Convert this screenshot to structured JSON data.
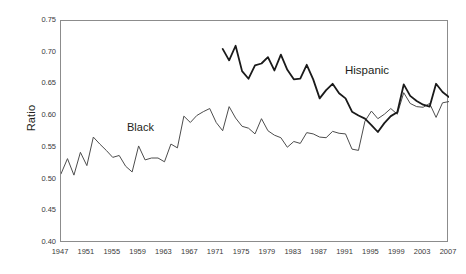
{
  "figure": {
    "ylabel": "Ratio",
    "background": "#ffffff",
    "frame_color": "#8c8c8c",
    "text_color": "#231f20"
  },
  "annotations": [
    {
      "name": "black-series-label",
      "text": "Black"
    },
    {
      "name": "hispanic-series-label",
      "text": "Hispanic"
    }
  ],
  "chart_data": {
    "type": "line",
    "title": "",
    "subtitle": "",
    "xlabel": "",
    "ylabel": "Ratio",
    "xlim": [
      1947,
      2007
    ],
    "ylim": [
      0.4,
      0.75
    ],
    "grid": false,
    "legend": "inline-annotation",
    "x_tick_labels": [
      "1947",
      "1951",
      "1955",
      "1959",
      "1963",
      "1967",
      "1971",
      "1975",
      "1979",
      "1983",
      "1987",
      "1991",
      "1995",
      "1999",
      "2003",
      "2007"
    ],
    "y_tick_labels": [
      "0.40",
      "0.45",
      "0.50",
      "0.55",
      "0.60",
      "0.65",
      "0.70",
      "0.75"
    ],
    "y_tick_values": [
      0.4,
      0.45,
      0.5,
      0.55,
      0.6,
      0.65,
      0.7,
      0.75
    ],
    "series": [
      {
        "name": "Black",
        "color": "#4d4d4d",
        "line_width": 1.0,
        "x": [
          1947,
          1948,
          1949,
          1950,
          1951,
          1952,
          1953,
          1954,
          1955,
          1956,
          1957,
          1958,
          1959,
          1960,
          1961,
          1962,
          1963,
          1964,
          1965,
          1966,
          1967,
          1968,
          1969,
          1970,
          1971,
          1972,
          1973,
          1974,
          1975,
          1976,
          1977,
          1978,
          1979,
          1980,
          1981,
          1982,
          1983,
          1984,
          1985,
          1986,
          1987,
          1988,
          1989,
          1990,
          1991,
          1992,
          1993,
          1994,
          1995,
          1996,
          1997,
          1998,
          1999,
          2000,
          2001,
          2002,
          2003,
          2004,
          2005,
          2006,
          2007
        ],
        "values": [
          0.509,
          0.533,
          0.507,
          0.543,
          0.522,
          0.567,
          0.556,
          0.546,
          0.535,
          0.538,
          0.521,
          0.512,
          0.553,
          0.531,
          0.534,
          0.534,
          0.528,
          0.556,
          0.55,
          0.6,
          0.59,
          0.601,
          0.607,
          0.612,
          0.59,
          0.577,
          0.615,
          0.597,
          0.584,
          0.581,
          0.572,
          0.596,
          0.577,
          0.57,
          0.566,
          0.551,
          0.56,
          0.557,
          0.574,
          0.572,
          0.567,
          0.566,
          0.576,
          0.573,
          0.572,
          0.548,
          0.546,
          0.592,
          0.608,
          0.596,
          0.603,
          0.612,
          0.603,
          0.637,
          0.62,
          0.615,
          0.614,
          0.62,
          0.598,
          0.621,
          0.623
        ]
      },
      {
        "name": "Hispanic",
        "color": "#1a1a1a",
        "line_width": 1.8,
        "x": [
          1972,
          1973,
          1974,
          1975,
          1976,
          1977,
          1978,
          1979,
          1980,
          1981,
          1982,
          1983,
          1984,
          1985,
          1986,
          1987,
          1988,
          1989,
          1990,
          1991,
          1992,
          1993,
          1994,
          1995,
          1996,
          1997,
          1998,
          1999,
          2000,
          2001,
          2002,
          2003,
          2004,
          2005,
          2006,
          2007
        ],
        "values": [
          0.706,
          0.688,
          0.711,
          0.671,
          0.659,
          0.68,
          0.683,
          0.693,
          0.672,
          0.697,
          0.673,
          0.658,
          0.659,
          0.681,
          0.658,
          0.628,
          0.641,
          0.651,
          0.636,
          0.628,
          0.607,
          0.601,
          0.596,
          0.586,
          0.575,
          0.589,
          0.6,
          0.606,
          0.65,
          0.632,
          0.624,
          0.618,
          0.615,
          0.651,
          0.638,
          0.63
        ]
      }
    ]
  }
}
